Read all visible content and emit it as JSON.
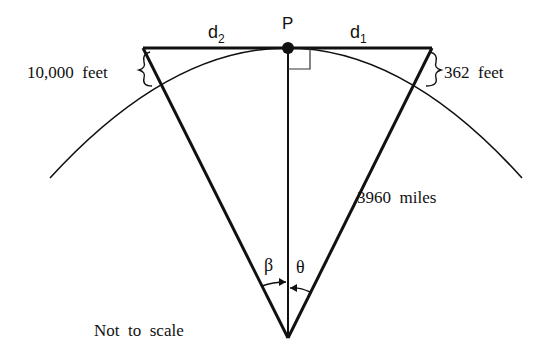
{
  "diagram": {
    "type": "geometry",
    "labels": {
      "point": "P",
      "d1": "d",
      "d1_sub": "1",
      "d2": "d",
      "d2_sub": "2",
      "left_height": "10,000  feet",
      "right_height": "362  feet",
      "radius": "3960  miles",
      "angle_left": "β",
      "angle_right": "θ",
      "note": "Not  to  scale"
    },
    "colors": {
      "stroke": "#111111",
      "background": "#ffffff"
    }
  }
}
